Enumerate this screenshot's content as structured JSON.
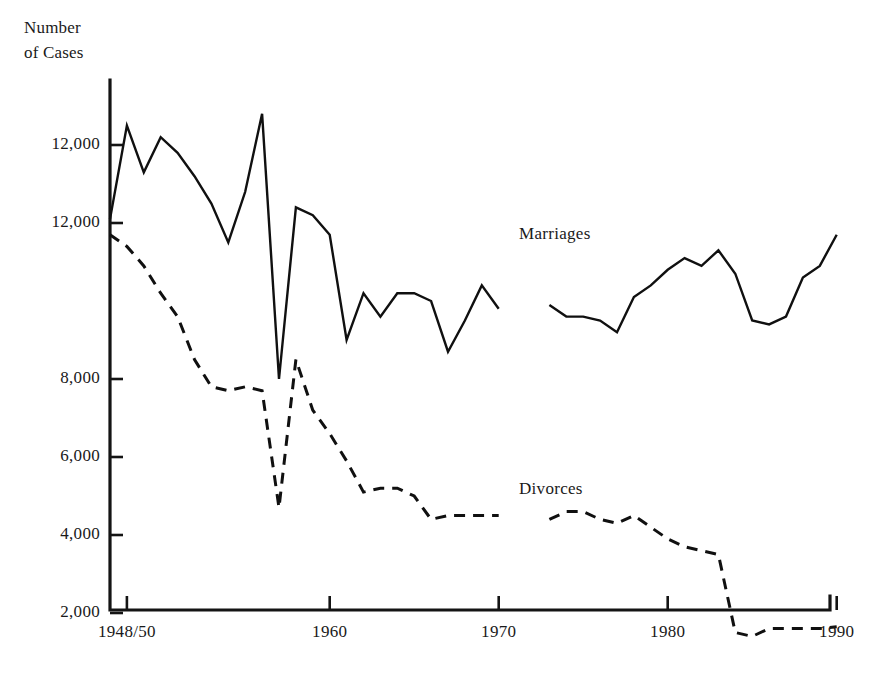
{
  "figure": {
    "width": 873,
    "height": 681,
    "background": "#ffffff",
    "ink_color": "#101010"
  },
  "axis_title": "Number\nof Cases",
  "series_labels": {
    "marriages": "Marriages",
    "divorces": "Divorces"
  },
  "chart_data": {
    "type": "line",
    "title": "Number of Cases",
    "xlabel": "",
    "ylabel": "Number of Cases",
    "grid": false,
    "legend_position": "inline-annotation",
    "xlim": [
      1947,
      1990
    ],
    "ylim": [
      0,
      14600
    ],
    "ytick_labels": [
      "12,000",
      "12,000",
      "8,000",
      "6,000",
      "4,000",
      "2,000"
    ],
    "ytick_values": [
      14000,
      12000,
      8000,
      6000,
      4000,
      2000
    ],
    "xtick_labels": [
      "1948/50",
      "1960",
      "1970",
      "1980",
      "1990"
    ],
    "xtick_values": [
      1948,
      1960,
      1970,
      1980,
      1990
    ],
    "series": [
      {
        "name": "Marriages",
        "style": "solid",
        "x": [
          1947,
          1948,
          1949,
          1950,
          1951,
          1952,
          1953,
          1954,
          1955,
          1956,
          1957,
          1958,
          1959,
          1960,
          1961,
          1962,
          1963,
          1964,
          1965,
          1966,
          1967,
          1968,
          1969,
          1970
        ],
        "values": [
          12100,
          14500,
          13300,
          14200,
          13800,
          13200,
          12500,
          11500,
          12800,
          14800,
          8000,
          12400,
          12200,
          11700,
          9000,
          10200,
          9600,
          10200,
          10200,
          10000,
          8700,
          9500,
          10400,
          9800
        ],
        "gap_after": 1970
      },
      {
        "name": "Marriages",
        "style": "solid",
        "x": [
          1973,
          1974,
          1975,
          1976,
          1977,
          1978,
          1979,
          1980,
          1981,
          1982,
          1983,
          1984,
          1985,
          1986,
          1987,
          1988,
          1989,
          1990
        ],
        "values": [
          9900,
          9600,
          9600,
          9500,
          9200,
          10100,
          10400,
          10800,
          11100,
          10900,
          11300,
          10700,
          9500,
          9400,
          9600,
          10600,
          10900,
          11700
        ],
        "segment": 2
      },
      {
        "name": "Divorces",
        "style": "dashed",
        "x": [
          1947,
          1948,
          1949,
          1950,
          1951,
          1952,
          1953,
          1954,
          1955,
          1956,
          1957,
          1958,
          1959,
          1960,
          1961,
          1962,
          1963,
          1964,
          1965,
          1966,
          1967,
          1968,
          1969,
          1970
        ],
        "values": [
          11700,
          11400,
          10900,
          10200,
          9600,
          8500,
          7800,
          7700,
          7800,
          7700,
          4700,
          8500,
          7200,
          6600,
          5900,
          5100,
          5200,
          5200,
          5000,
          4400,
          4500,
          4500,
          4500,
          4500
        ],
        "gap_after": 1970
      },
      {
        "name": "Divorces",
        "style": "dashed",
        "x": [
          1973,
          1974,
          1975,
          1976,
          1977,
          1978,
          1979,
          1980,
          1981,
          1982,
          1983,
          1984,
          1985,
          1986,
          1987,
          1988,
          1989,
          1990
        ],
        "values": [
          4400,
          4600,
          4600,
          4400,
          4300,
          4500,
          4200,
          3900,
          3700,
          3600,
          3500,
          1500,
          1400,
          1600,
          1600,
          1600,
          1600,
          1650
        ],
        "segment": 2
      }
    ]
  },
  "geometry": {
    "plot_left": 110,
    "plot_bottom": 610,
    "plot_right": 830,
    "plot_top": 80,
    "x_origin_year": 1947,
    "px_per_year": 16.9,
    "y_value_at_origin": 0,
    "px_per_unit": 0.039
  }
}
